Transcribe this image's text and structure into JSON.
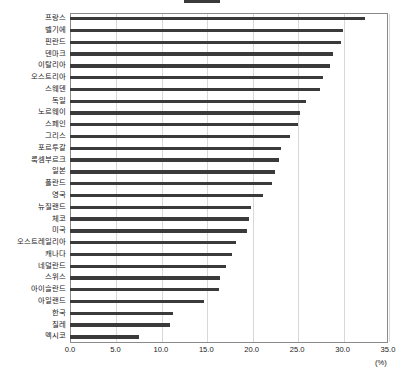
{
  "legend": {
    "series_label": "",
    "swatch_color": "#3a3a3a"
  },
  "axis": {
    "x_unit": "(%)",
    "x_ticks": [
      "0.0",
      "5.0",
      "10.0",
      "15.0",
      "20.0",
      "25.0",
      "30.0",
      "35.0"
    ]
  },
  "chart_data": {
    "type": "bar",
    "orientation": "horizontal",
    "title": "",
    "xlabel": "(%)",
    "ylabel": "",
    "xlim": [
      0.0,
      35.0
    ],
    "xtick_step": 5.0,
    "grid": true,
    "legend_position": "top-center",
    "bar_color": "#3a3a3a",
    "categories": [
      "프랑스",
      "벨기에",
      "핀란드",
      "덴마크",
      "이탈리아",
      "오스트리아",
      "스웨덴",
      "독일",
      "노르웨이",
      "스페인",
      "그리스",
      "포르투갈",
      "룩셈부르크",
      "일본",
      "폴란드",
      "영국",
      "뉴질랜드",
      "체코",
      "미국",
      "오스트레일리아",
      "캐나다",
      "네덜란드",
      "스위스",
      "아이슬란드",
      "아일랜드",
      "한국",
      "칠레",
      "멕시코"
    ],
    "values": [
      32.5,
      30.1,
      29.8,
      28.9,
      28.6,
      27.8,
      27.5,
      26.0,
      25.3,
      25.1,
      24.2,
      23.2,
      23.0,
      22.6,
      22.2,
      21.2,
      19.9,
      19.7,
      19.5,
      18.3,
      17.8,
      17.2,
      16.5,
      16.4,
      14.8,
      11.3,
      11.0,
      7.6
    ]
  }
}
